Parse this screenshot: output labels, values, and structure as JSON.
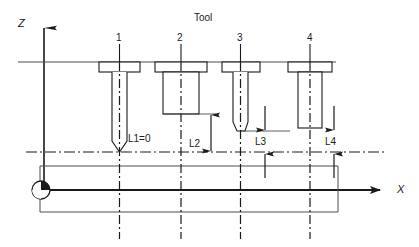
{
  "diagram": {
    "axes": {
      "z_label": "Z",
      "x_label": "X",
      "origin_marker": "workpiece-zero-symbol"
    },
    "header_label": "Tool",
    "colors": {
      "line": "#1a1a1a",
      "thin": "#4d4d4d",
      "background": "#ffffff"
    },
    "tools": [
      {
        "number": "1",
        "dim_label": "L1=0",
        "tip": "pointed",
        "body": "slender"
      },
      {
        "number": "2",
        "dim_label": "L2",
        "tip": "flat",
        "body": "wide-short"
      },
      {
        "number": "3",
        "dim_label": "L3",
        "tip": "rounded",
        "body": "slender"
      },
      {
        "number": "4",
        "dim_label": "L4",
        "tip": "flat",
        "body": "medium"
      }
    ],
    "dimensions": [
      {
        "name": "L1=0",
        "value": "L1=0"
      },
      {
        "name": "L2",
        "value": "L2"
      },
      {
        "name": "L3",
        "value": "L3"
      },
      {
        "name": "L4",
        "value": "L4"
      }
    ]
  }
}
